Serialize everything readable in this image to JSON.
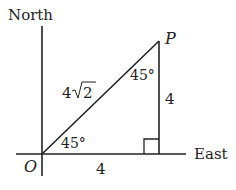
{
  "diagram": {
    "type": "right-triangle-bearing",
    "axes": {
      "north_label": "North",
      "east_label": "East"
    },
    "points": {
      "origin_label": "O",
      "point_label": "P"
    },
    "sides": {
      "hypotenuse": "4√2",
      "hypotenuse_coef": "4",
      "hypotenuse_rad": "2",
      "vertical": "4",
      "horizontal": "4"
    },
    "angles": {
      "at_origin": "45°",
      "at_p": "45°"
    },
    "right_angle_marker": true,
    "line_color": "#222222"
  }
}
